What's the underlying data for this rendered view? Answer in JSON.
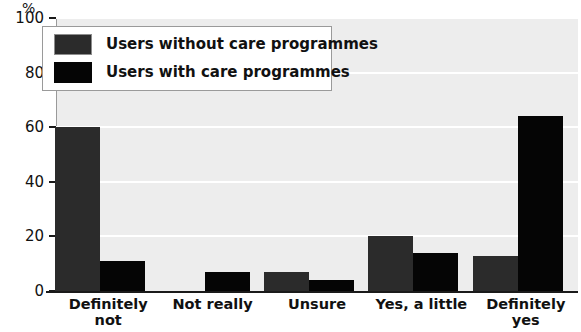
{
  "chart_data": {
    "type": "bar",
    "title_visible_fragment": "",
    "xlabel": "",
    "ylabel": "%",
    "ylim": [
      0,
      100
    ],
    "yticks": [
      0,
      20,
      40,
      60,
      80,
      100
    ],
    "ytick_labels": [
      "0",
      "20",
      "40",
      "60",
      "80",
      "100"
    ],
    "grid": true,
    "grid_orientation": "horizontal",
    "legend_position": "upper left",
    "categories": [
      "Definitely\nnot",
      "Not really",
      "Unsure",
      "Yes, a little",
      "Definitely\nyes"
    ],
    "series": [
      {
        "name": "Users without care programmes",
        "color": "#2b2b2b",
        "values": [
          60,
          0,
          7,
          20,
          13
        ]
      },
      {
        "name": "Users with care programmes",
        "color": "#050505",
        "values": [
          11,
          7,
          4,
          14,
          64
        ]
      }
    ]
  },
  "axes": {
    "unit_label": "%"
  },
  "legend": {
    "entries": [
      {
        "label": "Users without care programmes",
        "swatch": "dark-gray-swatch"
      },
      {
        "label": "Users with care programmes",
        "swatch": "black-swatch"
      }
    ]
  }
}
